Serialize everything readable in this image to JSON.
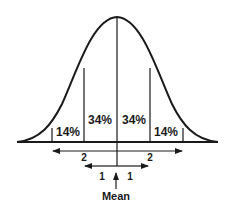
{
  "diagram": {
    "type": "normal-distribution",
    "regions": [
      {
        "label": "14%",
        "position": "-2 to -1 SD"
      },
      {
        "label": "34%",
        "position": "-1 SD to mean"
      },
      {
        "label": "34%",
        "position": "mean to +1 SD"
      },
      {
        "label": "14%",
        "position": "+1 to +2 SD"
      }
    ],
    "arrows": {
      "two_sd": {
        "left_label": "2",
        "right_label": "2"
      },
      "one_sd": {
        "left_label": "1",
        "right_label": "1"
      }
    },
    "mean_label": "Mean",
    "colors": {
      "stroke": "#1a1a1a",
      "background": "#ffffff"
    }
  }
}
